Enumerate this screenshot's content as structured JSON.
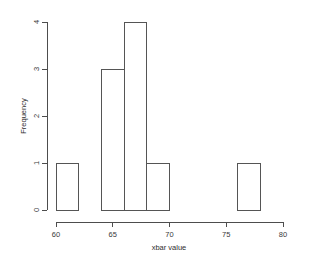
{
  "chart_data": {
    "type": "bar",
    "subtype": "histogram",
    "title": "",
    "xlabel": "xbar value",
    "ylabel": "Frequency",
    "xlim": [
      60,
      80
    ],
    "ylim": [
      0,
      4
    ],
    "xticks": [
      "60",
      "65",
      "70",
      "75",
      "80"
    ],
    "xtick_values": [
      60,
      65,
      70,
      75,
      80
    ],
    "yticks": [
      "0",
      "1",
      "2",
      "3",
      "4"
    ],
    "ytick_values": [
      0,
      1,
      2,
      3,
      4
    ],
    "grid": false,
    "legend": "none",
    "bin_width": 2,
    "bin_edges": [
      60,
      62,
      64,
      66,
      68,
      70,
      72,
      74,
      76,
      78
    ],
    "categories": [
      "60-62",
      "62-64",
      "64-66",
      "66-68",
      "68-70",
      "70-72",
      "72-74",
      "74-76",
      "76-78"
    ],
    "values": [
      1,
      0,
      3,
      4,
      1,
      0,
      0,
      0,
      1
    ],
    "bars": [
      {
        "x0": 60,
        "x1": 62,
        "count": 1
      },
      {
        "x0": 62,
        "x1": 64,
        "count": 0
      },
      {
        "x0": 64,
        "x1": 66,
        "count": 3
      },
      {
        "x0": 66,
        "x1": 68,
        "count": 4
      },
      {
        "x0": 68,
        "x1": 70,
        "count": 1
      },
      {
        "x0": 70,
        "x1": 72,
        "count": 0
      },
      {
        "x0": 72,
        "x1": 74,
        "count": 0
      },
      {
        "x0": 74,
        "x1": 76,
        "count": 0
      },
      {
        "x0": 76,
        "x1": 78,
        "count": 1
      }
    ],
    "total_count": 10,
    "colors": {
      "bar_stroke": "#555555",
      "bar_fill": "none",
      "axis": "#4d4d4d",
      "text": "#2e2e2e",
      "background": "#ffffff"
    }
  }
}
